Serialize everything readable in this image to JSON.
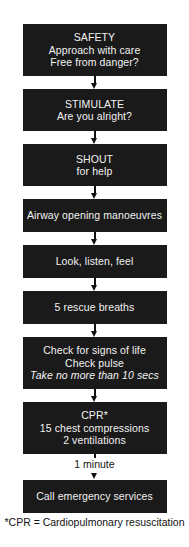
{
  "chart_data": {
    "type": "diagram",
    "orientation": "vertical",
    "node_count": 9
  },
  "flowchart": {
    "nodes": [
      {
        "id": "safety",
        "lines": [
          "SAFETY",
          "Approach with care",
          "Free from danger?"
        ]
      },
      {
        "id": "stimulate",
        "lines": [
          "STIMULATE",
          "Are you alright?"
        ]
      },
      {
        "id": "shout",
        "lines": [
          "SHOUT",
          "for help"
        ]
      },
      {
        "id": "airway",
        "lines": [
          "Airway opening manoeuvres"
        ]
      },
      {
        "id": "look-listen-feel",
        "lines": [
          "Look, listen, feel"
        ]
      },
      {
        "id": "rescue-breaths",
        "lines": [
          "5 rescue breaths"
        ]
      },
      {
        "id": "signs-of-life",
        "lines": [
          "Check for signs of life",
          "Check pulse",
          "Take no more than 10 secs"
        ],
        "italic_lines": [
          2
        ]
      },
      {
        "id": "cpr",
        "lines": [
          "CPR*",
          "15 chest compressions",
          "2 ventilations"
        ]
      },
      {
        "id": "call-emergency",
        "lines": [
          "Call emergency services"
        ]
      }
    ],
    "connector_labels": {
      "cpr_to_call": "1 minute"
    },
    "footnote": "*CPR = Cardiopulmonary resuscitation",
    "colors": {
      "node_background": "#1a1a1a",
      "node_text": "#f2f2f2",
      "page_background": "#ffffff",
      "connector": "#111111",
      "footnote_text": "#111111"
    }
  }
}
